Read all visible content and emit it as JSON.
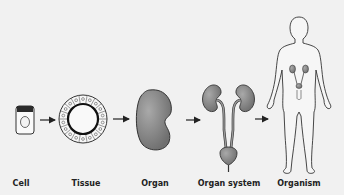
{
  "figure": {
    "stages": [
      {
        "id": "cell",
        "label": "Cell",
        "x": 21
      },
      {
        "id": "tissue",
        "label": "Tissue",
        "x": 86
      },
      {
        "id": "organ",
        "label": "Organ",
        "x": 155
      },
      {
        "id": "organ-system",
        "label": "Organ system",
        "x": 229
      },
      {
        "id": "organism",
        "label": "Organism",
        "x": 299
      }
    ],
    "arrows": 4,
    "colors": {
      "background": "#f1f1f1",
      "organ_fill": "#8a8a8a",
      "outline": "#333333",
      "body_fill": "#f4f4f4"
    }
  }
}
